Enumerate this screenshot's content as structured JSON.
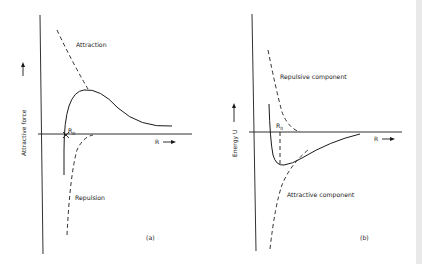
{
  "panel_a": {
    "tag": "(a)",
    "y_axis_label": "Attractive force",
    "x_axis_label": "R",
    "point_label": "R",
    "point_label_sub": "0",
    "curve_labels": {
      "upper_dashed": "Attraction",
      "lower_dashed": "Repulsion"
    },
    "arrow_glyph": "→"
  },
  "panel_b": {
    "tag": "(b)",
    "y_axis_label": "Energy  U",
    "x_axis_label": "R",
    "point_label": "R",
    "point_label_sub": "0",
    "curve_labels": {
      "upper_dashed": "Repulsive component",
      "lower_dashed": "Attractive component"
    },
    "arrow_glyph": "→"
  }
}
